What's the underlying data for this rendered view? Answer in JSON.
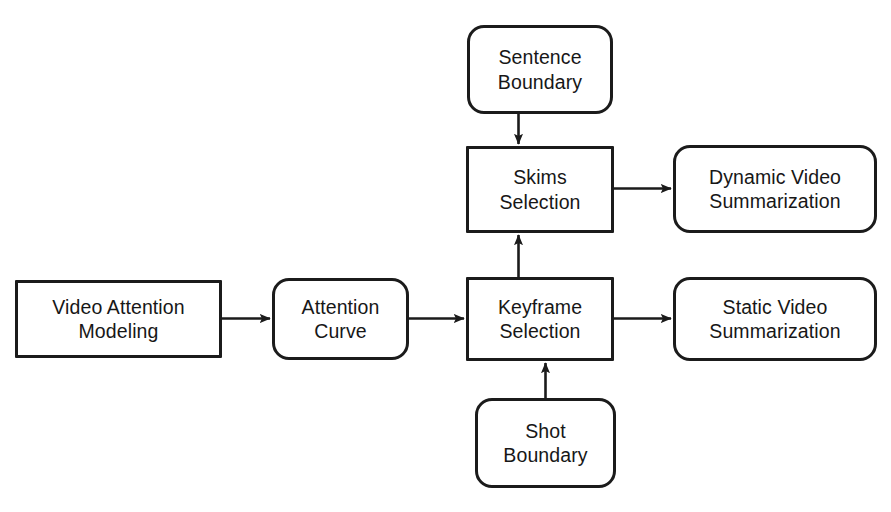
{
  "diagram": {
    "background_color": "#ffffff",
    "stroke_color": "#1b1b1b",
    "text_color": "#171717",
    "nodes": [
      {
        "id": "video-attention-modeling",
        "label": "Video Attention\nModeling",
        "shape": "rectangle"
      },
      {
        "id": "attention-curve",
        "label": "Attention\nCurve",
        "shape": "rounded-rectangle"
      },
      {
        "id": "keyframe-selection",
        "label": "Keyframe\nSelection",
        "shape": "rectangle"
      },
      {
        "id": "skims-selection",
        "label": "Skims\nSelection",
        "shape": "rectangle"
      },
      {
        "id": "sentence-boundary",
        "label": "Sentence\nBoundary",
        "shape": "rounded-rectangle"
      },
      {
        "id": "shot-boundary",
        "label": "Shot\nBoundary",
        "shape": "rounded-rectangle"
      },
      {
        "id": "dynamic-video-summarization",
        "label": "Dynamic Video\nSummarization",
        "shape": "rounded-rectangle"
      },
      {
        "id": "static-video-summarization",
        "label": "Static Video\nSummarization",
        "shape": "rounded-rectangle"
      }
    ],
    "edges": [
      {
        "id": "edge-vam-to-curve",
        "from": "video-attention-modeling",
        "to": "attention-curve",
        "direction": "right"
      },
      {
        "id": "edge-curve-to-keyframe",
        "from": "attention-curve",
        "to": "keyframe-selection",
        "direction": "right"
      },
      {
        "id": "edge-keyframe-to-static",
        "from": "keyframe-selection",
        "to": "static-video-summarization",
        "direction": "right"
      },
      {
        "id": "edge-skims-to-dynamic",
        "from": "skims-selection",
        "to": "dynamic-video-summarization",
        "direction": "right"
      },
      {
        "id": "edge-sentence-to-skims",
        "from": "sentence-boundary",
        "to": "skims-selection",
        "direction": "down"
      },
      {
        "id": "edge-keyframe-to-skims",
        "from": "keyframe-selection",
        "to": "skims-selection",
        "direction": "up"
      },
      {
        "id": "edge-shot-to-keyframe",
        "from": "shot-boundary",
        "to": "keyframe-selection",
        "direction": "up"
      }
    ]
  }
}
